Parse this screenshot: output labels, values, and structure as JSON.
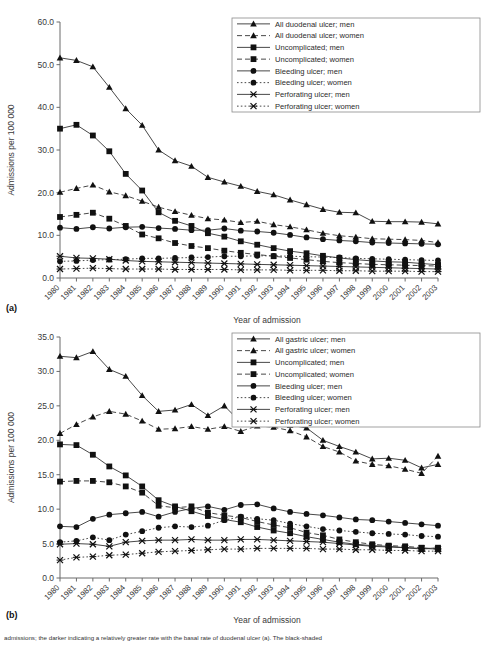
{
  "figure": {
    "panel_a_label": "(a)",
    "panel_b_label": "(b)",
    "caption": "admissions; the darker indicating a relatively greater rate with the basal rate of duodenal ulcer (a). The black-shaded"
  },
  "chart_data": [
    {
      "id": "chart-a",
      "type": "line",
      "title": "",
      "xlabel": "Year of admission",
      "ylabel": "Admissions per 100 000",
      "ylim": [
        0.0,
        60.0
      ],
      "yticks": [
        "0.0",
        "10.0",
        "20.0",
        "30.0",
        "40.0",
        "50.0",
        "60.0"
      ],
      "ytick_values": [
        0,
        10,
        20,
        30,
        40,
        50,
        60
      ],
      "grid": false,
      "legend_position": "top-right",
      "categories": [
        "1980",
        "1981",
        "1982",
        "1983",
        "1984",
        "1985",
        "1986",
        "1987",
        "1988",
        "1989",
        "1990",
        "1991",
        "1992",
        "1993",
        "1994",
        "1995",
        "1996",
        "1997",
        "1998",
        "1999",
        "2000",
        "2001",
        "2002",
        "2003"
      ],
      "series": [
        {
          "name": "All duodenal ulcer; men",
          "marker": "triangle",
          "dash": "solid",
          "values": [
            51.6,
            51.0,
            49.5,
            44.7,
            39.7,
            35.8,
            30.0,
            27.5,
            26.2,
            23.6,
            22.5,
            21.5,
            20.3,
            19.5,
            18.3,
            17.2,
            16.1,
            15.4,
            15.3,
            13.3,
            13.2,
            13.2,
            13.1,
            12.7
          ]
        },
        {
          "name": "All duodenal ulcer; women",
          "marker": "triangle",
          "dash": "dashed",
          "values": [
            20.1,
            21.0,
            21.8,
            20.2,
            19.3,
            18.0,
            16.6,
            15.6,
            14.7,
            13.9,
            13.6,
            13.0,
            13.3,
            12.5,
            12.0,
            11.3,
            10.5,
            9.9,
            9.6,
            9.2,
            9.1,
            9.0,
            8.8,
            8.3
          ]
        },
        {
          "name": "Uncomplicated; men",
          "marker": "square",
          "dash": "solid",
          "values": [
            35.0,
            35.9,
            33.4,
            29.7,
            24.4,
            20.5,
            15.4,
            13.4,
            12.2,
            10.5,
            9.7,
            8.6,
            7.8,
            7.0,
            6.3,
            5.8,
            5.2,
            4.7,
            4.3,
            4.0,
            3.8,
            3.7,
            3.4,
            3.1
          ]
        },
        {
          "name": "Uncomplicated; women",
          "marker": "square",
          "dash": "dashed",
          "values": [
            14.3,
            14.8,
            15.3,
            13.9,
            12.2,
            10.2,
            9.3,
            8.2,
            7.5,
            7.0,
            6.4,
            5.9,
            5.5,
            5.1,
            4.7,
            4.3,
            3.9,
            3.6,
            3.4,
            3.2,
            3.1,
            3.0,
            2.9,
            2.8
          ]
        },
        {
          "name": "Bleeding ulcer; men",
          "marker": "circle",
          "dash": "solid",
          "values": [
            11.8,
            11.5,
            11.9,
            11.6,
            11.9,
            12.0,
            11.7,
            11.5,
            11.2,
            11.2,
            11.6,
            11.1,
            10.9,
            10.6,
            10.1,
            9.5,
            9.1,
            8.8,
            8.6,
            8.3,
            8.2,
            8.1,
            8.0,
            7.9
          ]
        },
        {
          "name": "Bleeding ulcer; women",
          "marker": "circle",
          "dash": "dotted",
          "values": [
            3.9,
            4.0,
            4.2,
            4.3,
            4.4,
            4.6,
            4.6,
            4.7,
            4.8,
            4.9,
            5.1,
            5.1,
            5.2,
            5.2,
            5.1,
            5.0,
            4.9,
            4.8,
            4.6,
            4.5,
            4.4,
            4.3,
            4.2,
            4.1
          ]
        },
        {
          "name": "Perforating ulcer; men",
          "marker": "cross",
          "dash": "solid",
          "values": [
            5.1,
            4.7,
            4.6,
            4.4,
            4.1,
            3.9,
            3.8,
            3.7,
            3.6,
            3.5,
            3.4,
            3.3,
            3.2,
            3.1,
            3.0,
            2.9,
            2.8,
            2.7,
            2.6,
            2.5,
            2.4,
            2.3,
            2.2,
            2.1
          ]
        },
        {
          "name": "Perforating ulcer; women",
          "marker": "cross",
          "dash": "dotted",
          "values": [
            2.1,
            2.2,
            2.3,
            2.2,
            2.1,
            2.1,
            2.1,
            2.0,
            2.0,
            2.0,
            2.0,
            1.9,
            1.9,
            1.9,
            1.8,
            1.8,
            1.8,
            1.7,
            1.7,
            1.6,
            1.6,
            1.6,
            1.5,
            1.5
          ]
        }
      ]
    },
    {
      "id": "chart-b",
      "type": "line",
      "title": "",
      "xlabel": "Year of admission",
      "ylabel": "Admissions per 100 000",
      "ylim": [
        0.0,
        35.0
      ],
      "yticks": [
        "0.0",
        "5.0",
        "10.0",
        "15.0",
        "20.0",
        "25.0",
        "30.0",
        "35.0"
      ],
      "ytick_values": [
        0,
        5,
        10,
        15,
        20,
        25,
        30,
        35
      ],
      "grid": false,
      "legend_position": "top-right",
      "categories": [
        "1980",
        "1981",
        "1982",
        "1983",
        "1984",
        "1985",
        "1986",
        "1987",
        "1988",
        "1989",
        "1990",
        "1991",
        "1992",
        "1993",
        "1994",
        "1995",
        "1996",
        "1997",
        "1998",
        "1999",
        "2000",
        "2001",
        "2002",
        "2003"
      ],
      "series": [
        {
          "name": "All gastric ulcer; men",
          "marker": "triangle",
          "dash": "solid",
          "values": [
            32.2,
            32.0,
            32.9,
            30.3,
            29.3,
            26.5,
            24.2,
            24.4,
            25.2,
            23.6,
            25.0,
            22.6,
            22.8,
            22.7,
            22.2,
            21.8,
            20.0,
            19.1,
            18.3,
            17.3,
            17.4,
            17.1,
            16.0,
            16.5
          ]
        },
        {
          "name": "All gastric ulcer; women",
          "marker": "triangle",
          "dash": "dashed",
          "values": [
            21.0,
            22.3,
            23.4,
            24.2,
            23.8,
            22.8,
            21.6,
            21.7,
            22.0,
            21.6,
            22.0,
            21.3,
            22.1,
            21.9,
            21.4,
            20.5,
            19.1,
            18.3,
            17.0,
            16.5,
            16.3,
            15.8,
            15.2,
            17.7
          ]
        },
        {
          "name": "Uncomplicated; men",
          "marker": "square",
          "dash": "solid",
          "values": [
            19.4,
            19.3,
            17.9,
            16.2,
            14.9,
            13.3,
            11.3,
            10.4,
            9.7,
            9.0,
            8.5,
            8.1,
            7.4,
            6.9,
            6.5,
            6.0,
            5.6,
            5.2,
            4.9,
            4.7,
            4.6,
            4.4,
            4.2,
            4.4
          ]
        },
        {
          "name": "Uncomplicated; women",
          "marker": "square",
          "dash": "dashed",
          "values": [
            14.0,
            14.1,
            14.1,
            13.9,
            13.3,
            12.4,
            10.5,
            10.2,
            10.4,
            9.5,
            9.1,
            8.8,
            8.2,
            7.7,
            7.3,
            6.6,
            6.2,
            5.6,
            5.2,
            4.9,
            4.7,
            4.6,
            4.4,
            4.2
          ]
        },
        {
          "name": "Bleeding ulcer; men",
          "marker": "circle",
          "dash": "solid",
          "values": [
            7.5,
            7.4,
            8.6,
            9.2,
            9.4,
            9.6,
            8.9,
            9.6,
            10.1,
            10.4,
            9.9,
            10.6,
            10.7,
            10.1,
            9.6,
            9.3,
            9.1,
            8.8,
            8.5,
            8.4,
            8.2,
            8.0,
            7.8,
            7.6
          ]
        },
        {
          "name": "Bleeding ulcer; women",
          "marker": "circle",
          "dash": "dotted",
          "values": [
            5.2,
            5.4,
            5.9,
            5.5,
            6.3,
            6.8,
            7.3,
            7.5,
            7.4,
            7.6,
            8.4,
            8.9,
            8.6,
            8.4,
            7.9,
            7.5,
            7.1,
            6.9,
            6.7,
            6.5,
            6.4,
            6.3,
            6.1,
            6.0
          ]
        },
        {
          "name": "Perforating ulcer; men",
          "marker": "cross",
          "dash": "solid",
          "values": [
            4.9,
            5.0,
            4.9,
            4.6,
            5.2,
            5.4,
            5.5,
            5.5,
            5.6,
            5.5,
            5.5,
            5.6,
            5.6,
            5.5,
            5.4,
            5.3,
            5.2,
            5.0,
            4.8,
            4.6,
            4.5,
            4.4,
            4.3,
            4.2
          ]
        },
        {
          "name": "Perforating ulcer; women",
          "marker": "cross",
          "dash": "dotted",
          "values": [
            2.6,
            3.0,
            3.1,
            3.3,
            3.4,
            3.6,
            3.8,
            3.9,
            4.0,
            4.1,
            4.2,
            4.2,
            4.3,
            4.3,
            4.3,
            4.3,
            4.2,
            4.2,
            4.1,
            4.1,
            4.0,
            4.0,
            3.9,
            3.9
          ]
        }
      ]
    }
  ]
}
